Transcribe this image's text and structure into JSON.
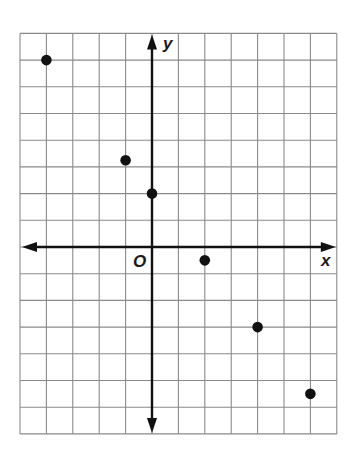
{
  "chart_data": {
    "type": "scatter",
    "title": "",
    "xlabel": "x",
    "ylabel": "y",
    "origin_label": "O",
    "xlim": [
      -5,
      7
    ],
    "ylim": [
      -7,
      8
    ],
    "grid": true,
    "grid_step": 1,
    "tick_labels": false,
    "points": [
      {
        "x": -4,
        "y": 7
      },
      {
        "x": -1,
        "y": 3.25
      },
      {
        "x": 0,
        "y": 2
      },
      {
        "x": 2,
        "y": -0.5
      },
      {
        "x": 4,
        "y": -3
      },
      {
        "x": 6,
        "y": -5.5
      }
    ]
  },
  "colors": {
    "grid": "#8a8a8a",
    "axis": "#111111",
    "point": "#111111",
    "background": "#ffffff"
  }
}
